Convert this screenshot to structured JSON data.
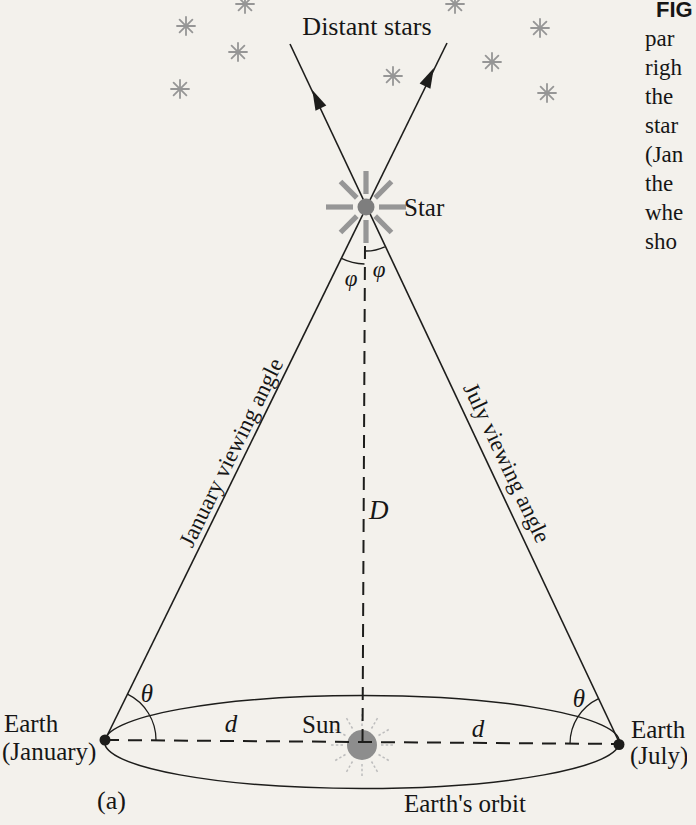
{
  "colors": {
    "paper": "#f3f1ec",
    "ink": "#1d1d1b",
    "gray": "#969696",
    "sun": "#8d8d8d",
    "sunray": "#bdbdbd",
    "text": "#161616"
  },
  "caption": {
    "lines": [
      "FIG",
      "par",
      "righ",
      "the",
      "star",
      "(Jan",
      "the",
      "whe",
      "sho"
    ]
  },
  "diagram": {
    "distant_stars": "Distant stars",
    "star": "Star",
    "phi": "φ",
    "january_viewing_angle": "January viewing angle",
    "july_viewing_angle": "July viewing angle",
    "distance_D": "D",
    "theta": "θ",
    "d": "d",
    "sun": "Sun",
    "earth_january": [
      "Earth",
      "(January)"
    ],
    "earth_july": [
      "Earth",
      "(July)"
    ],
    "panel": "(a)",
    "earths_orbit": "Earth's orbit"
  }
}
